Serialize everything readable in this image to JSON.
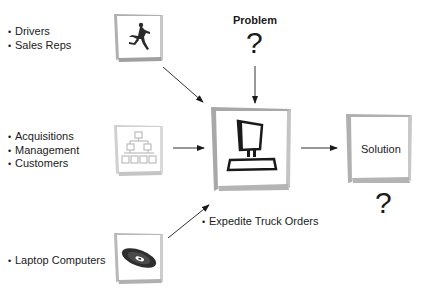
{
  "diagram": {
    "inputs": [
      {
        "id": "people",
        "icon": "runner-icon",
        "items": [
          "Drivers",
          "Sales Reps"
        ]
      },
      {
        "id": "organization",
        "icon": "org-chart-icon",
        "items": [
          "Acquisitions",
          "Management",
          "Customers"
        ]
      },
      {
        "id": "technology",
        "icon": "disc-icon",
        "items": [
          "Laptop Computers"
        ]
      }
    ],
    "problem": {
      "title": "Problem",
      "mark": "?"
    },
    "center": {
      "icon": "computer-icon",
      "caption": "Expedite Truck Orders"
    },
    "solution": {
      "label": "Solution",
      "mark": "?"
    },
    "arrows": [
      {
        "from": "people",
        "to": "center"
      },
      {
        "from": "problem",
        "to": "center"
      },
      {
        "from": "organization",
        "to": "center"
      },
      {
        "from": "technology",
        "to": "center"
      },
      {
        "from": "center",
        "to": "solution"
      }
    ],
    "colors": {
      "frame": "#a8a8a8",
      "ink": "#1a1a1a",
      "faded_ink": "#b5b5b5"
    }
  }
}
